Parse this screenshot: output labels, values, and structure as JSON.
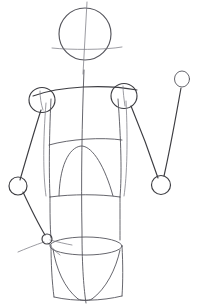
{
  "image": {
    "title": "Figure construction sketch",
    "subject": "human-torso-mannequin-line-drawing",
    "medium": "pencil-line-drawing",
    "width": 199,
    "height": 308
  },
  "colors": {
    "background": "#ffffff",
    "line_dark": "#3d3d42",
    "line_mid": "#55555c",
    "line_light": "#7b7b83"
  },
  "line_widths": {
    "main": 1.15,
    "light": 0.9,
    "faint": 0.75
  },
  "shapes": {
    "head": {
      "name": "head-circle",
      "cx": 85,
      "cy": 34,
      "rx": 26,
      "ry": 26
    },
    "head_vertical_guide": {
      "name": "head-center-vertical-guide",
      "x1": 87,
      "y1": 2,
      "x2": 83,
      "y2": 74
    },
    "head_horizontal_guide": {
      "name": "head-eyeline-horizontal-guide",
      "d": "M 52 48 C 70 50, 105 50, 122 47"
    },
    "spine_center_line": {
      "name": "spine-center-vertical-line",
      "d": "M 84 70 C 82 120, 81 180, 82 232 C 82 268, 84 290, 86 303"
    },
    "shoulder_left": {
      "name": "left-shoulder-joint-circle",
      "cx": 42,
      "cy": 100,
      "rx": 13,
      "ry": 12.5
    },
    "shoulder_right": {
      "name": "right-shoulder-joint-circle",
      "cx": 124,
      "cy": 96,
      "rx": 13,
      "ry": 12.5
    },
    "shoulder_line": {
      "name": "shoulder-span-curve",
      "d": "M 33 96 C 60 86, 105 84, 137 90"
    },
    "torso_left_edge": {
      "name": "torso-left-edge-line",
      "d": "M 51 99 C 49 140, 49 175, 50 197"
    },
    "torso_right_edge": {
      "name": "torso-right-edge-line",
      "d": "M 118 99 C 121 140, 122 175, 120 197"
    },
    "ribcage_bottom_line": {
      "name": "ribcage-bottom-line",
      "d": "M 49 145 C 70 139, 102 137, 122 140"
    },
    "ribcage_arc": {
      "name": "ribcage-sternum-arc",
      "d": "M 59 196 C 60 160, 72 146, 82 146 C 93 147, 105 167, 113 196"
    },
    "waist_top_line": {
      "name": "waist-top-line",
      "d": "M 50 197 C 72 194, 100 194, 120 197"
    },
    "waist_left_edge": {
      "name": "waist-left-edge-line",
      "d": "M 50 197 C 50 212, 50 227, 51 238"
    },
    "waist_right_edge": {
      "name": "waist-right-edge-line",
      "d": "M 120 197 C 120 212, 120 228, 120 240"
    },
    "hip_ellipse": {
      "name": "pelvis-top-ellipse",
      "cx": 86,
      "cy": 246,
      "rx": 36,
      "ry": 9
    },
    "hip_left_edge": {
      "name": "pelvis-left-edge-line",
      "d": "M 51 245 C 51 263, 52 282, 54 297"
    },
    "hip_right_edge": {
      "name": "pelvis-right-edge-line",
      "d": "M 122 246 C 123 264, 123 282, 122 296"
    },
    "hip_bottom_line": {
      "name": "pelvis-bottom-line",
      "d": "M 54 297 C 75 302, 102 301, 122 296"
    },
    "leg_left_taper": {
      "name": "left-leg-taper-curve",
      "d": "M 53 249 C 56 268, 64 288, 78 299"
    },
    "leg_right_taper": {
      "name": "right-leg-taper-curve",
      "d": "M 120 250 C 116 269, 106 289, 92 299"
    },
    "crotch_curve": {
      "name": "crotch-curve",
      "d": "M 78 299 C 82 301, 88 301, 92 299"
    },
    "arm_left_upper": {
      "name": "left-upper-arm-line",
      "d": "M 41 110 C 33 135, 25 163, 20 180"
    },
    "elbow_left": {
      "name": "left-elbow-joint-circle",
      "cx": 18,
      "cy": 186,
      "rx": 9,
      "ry": 9
    },
    "arm_left_fore": {
      "name": "left-forearm-line",
      "d": "M 23 192 C 30 207, 39 225, 45 235"
    },
    "hand_left": {
      "name": "left-hand-joint-circle",
      "cx": 47,
      "cy": 239,
      "rx": 5,
      "ry": 5
    },
    "hand_left_fingers": {
      "name": "left-hand-finger-strokes",
      "paths": [
        "M 44 242 C 35 245, 25 249, 18 252",
        "M 48 243 C 52 248, 56 252, 60 255",
        "M 50 240 C 58 242, 66 244, 72 245"
      ]
    },
    "arm_right_upper": {
      "name": "right-upper-arm-line",
      "d": "M 131 106 C 141 130, 152 160, 158 178"
    },
    "elbow_right": {
      "name": "right-elbow-joint-circle",
      "cx": 161,
      "cy": 185,
      "rx": 9.5,
      "ry": 9.5
    },
    "arm_right_fore": {
      "name": "right-forearm-line",
      "d": "M 164 176 C 171 145, 177 110, 181 88"
    },
    "hand_right": {
      "name": "right-hand-joint-circle",
      "cx": 182,
      "cy": 79,
      "rx": 7.5,
      "ry": 8
    },
    "torso_inner_left_line": {
      "name": "torso-inner-left-contour",
      "d": "M 46 103 C 43 140, 43 175, 46 196"
    },
    "torso_inner_right_line": {
      "name": "torso-inner-right-contour",
      "d": "M 126 101 C 128 140, 127 176, 124 196"
    },
    "shoulder_left_tick": {
      "name": "left-shoulder-tick-mark",
      "d": "M 40 91 C 40 97, 41 104, 43 110"
    },
    "shoulder_right_tick": {
      "name": "right-shoulder-tick-mark",
      "d": "M 123 86 C 123 92, 124 99, 125 106"
    }
  }
}
